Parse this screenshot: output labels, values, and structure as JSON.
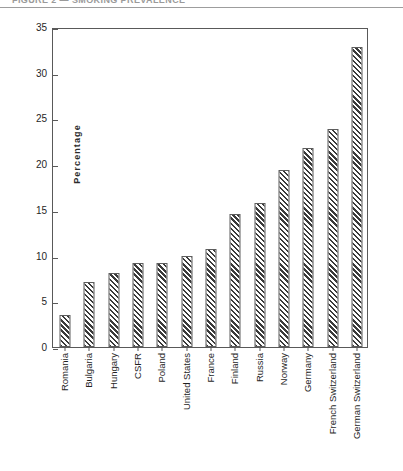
{
  "header": {
    "clipped_text": "FIGURE 2 — SMOKING PREVALENCE",
    "rule_name": "horizontal-rule"
  },
  "chart_data": {
    "type": "bar",
    "title": "",
    "xlabel": "",
    "ylabel": "Percentage",
    "ylim": [
      0,
      35
    ],
    "ytick_step": 5,
    "yticks": [
      35,
      30,
      25,
      20,
      15,
      10,
      5,
      0
    ],
    "grid": false,
    "legend": null,
    "bar_fill": "diagonal-hatch",
    "bar_outline_color": "#5d5d5d",
    "hatch_color": "#3b3b3b",
    "categories": [
      "Romania",
      "Bulgaria",
      "Hungary",
      "CSFR",
      "Poland",
      "United States",
      "France",
      "Finland",
      "Russia",
      "Norway",
      "Germany",
      "French Switzerland",
      "German Switzerland"
    ],
    "values": [
      3.5,
      7.1,
      8.1,
      9.2,
      9.2,
      10.0,
      10.7,
      14.5,
      15.7,
      19.4,
      21.8,
      23.9,
      32.8
    ]
  }
}
